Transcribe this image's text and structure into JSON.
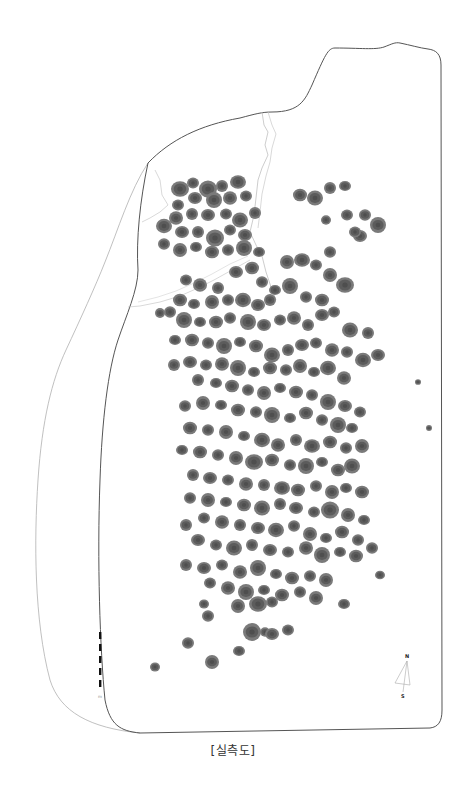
{
  "caption": "[실측도]",
  "colors": {
    "background": "#ffffff",
    "boundary_line": "#555555",
    "outer_line": "#aaaaaa",
    "crack_line": "#bbbbbb",
    "stone_outer": "#7a7a7a",
    "stone_inner": "#5c5c5c",
    "stone_core": "#4e4e4e",
    "scale_bar": "#111111"
  },
  "north_arrow": {
    "label_top": "N",
    "label_bottom": "S",
    "x": 407,
    "y": 655
  },
  "scale_bar": {
    "x": 100,
    "y_top": 632,
    "segments": 5,
    "segment_length": 7,
    "gap": 5,
    "label": "m"
  },
  "stones": [
    [
      180,
      189,
      9
    ],
    [
      193,
      183,
      6
    ],
    [
      208,
      189,
      9
    ],
    [
      222,
      186,
      6
    ],
    [
      238,
      182,
      8
    ],
    [
      246,
      196,
      6
    ],
    [
      230,
      198,
      7
    ],
    [
      214,
      200,
      8
    ],
    [
      195,
      198,
      7
    ],
    [
      178,
      205,
      6
    ],
    [
      176,
      218,
      7
    ],
    [
      192,
      214,
      6
    ],
    [
      208,
      215,
      7
    ],
    [
      226,
      214,
      6
    ],
    [
      240,
      220,
      8
    ],
    [
      255,
      213,
      6
    ],
    [
      245,
      235,
      7
    ],
    [
      230,
      230,
      6
    ],
    [
      215,
      238,
      9
    ],
    [
      198,
      232,
      6
    ],
    [
      182,
      232,
      7
    ],
    [
      164,
      226,
      8
    ],
    [
      164,
      244,
      6
    ],
    [
      180,
      250,
      7
    ],
    [
      196,
      247,
      6
    ],
    [
      212,
      252,
      7
    ],
    [
      228,
      250,
      6
    ],
    [
      244,
      248,
      8
    ],
    [
      259,
      252,
      6
    ],
    [
      300,
      195,
      7
    ],
    [
      315,
      198,
      8
    ],
    [
      330,
      188,
      6
    ],
    [
      345,
      186,
      6
    ],
    [
      347,
      215,
      6
    ],
    [
      365,
      215,
      6
    ],
    [
      378,
      225,
      8
    ],
    [
      360,
      236,
      7
    ],
    [
      355,
      232,
      6
    ],
    [
      326,
      220,
      5
    ],
    [
      287,
      262,
      7
    ],
    [
      302,
      260,
      8
    ],
    [
      316,
      265,
      6
    ],
    [
      330,
      252,
      6
    ],
    [
      330,
      275,
      7
    ],
    [
      345,
      285,
      9
    ],
    [
      322,
      300,
      7
    ],
    [
      306,
      297,
      6
    ],
    [
      290,
      286,
      8
    ],
    [
      275,
      290,
      6
    ],
    [
      186,
      280,
      6
    ],
    [
      200,
      285,
      7
    ],
    [
      218,
      288,
      6
    ],
    [
      236,
      272,
      7
    ],
    [
      252,
      268,
      7
    ],
    [
      262,
      282,
      6
    ],
    [
      270,
      300,
      6
    ],
    [
      258,
      305,
      7
    ],
    [
      243,
      300,
      8
    ],
    [
      228,
      300,
      6
    ],
    [
      212,
      302,
      7
    ],
    [
      194,
      304,
      6
    ],
    [
      180,
      300,
      7
    ],
    [
      170,
      312,
      6
    ],
    [
      184,
      320,
      8
    ],
    [
      200,
      322,
      6
    ],
    [
      216,
      322,
      7
    ],
    [
      230,
      318,
      6
    ],
    [
      248,
      322,
      8
    ],
    [
      264,
      325,
      7
    ],
    [
      280,
      320,
      6
    ],
    [
      294,
      318,
      7
    ],
    [
      308,
      325,
      6
    ],
    [
      322,
      315,
      7
    ],
    [
      334,
      312,
      6
    ],
    [
      350,
      330,
      8
    ],
    [
      368,
      333,
      6
    ],
    [
      378,
      355,
      7
    ],
    [
      363,
      360,
      8
    ],
    [
      347,
      352,
      6
    ],
    [
      160,
      313,
      5
    ],
    [
      175,
      340,
      6
    ],
    [
      192,
      340,
      7
    ],
    [
      208,
      343,
      6
    ],
    [
      224,
      346,
      8
    ],
    [
      240,
      342,
      6
    ],
    [
      256,
      346,
      7
    ],
    [
      272,
      355,
      8
    ],
    [
      288,
      350,
      6
    ],
    [
      302,
      345,
      7
    ],
    [
      316,
      343,
      6
    ],
    [
      332,
      350,
      7
    ],
    [
      174,
      365,
      6
    ],
    [
      190,
      362,
      7
    ],
    [
      206,
      365,
      6
    ],
    [
      222,
      364,
      7
    ],
    [
      238,
      368,
      8
    ],
    [
      254,
      372,
      6
    ],
    [
      270,
      368,
      7
    ],
    [
      286,
      370,
      6
    ],
    [
      300,
      366,
      7
    ],
    [
      314,
      372,
      6
    ],
    [
      328,
      368,
      8
    ],
    [
      344,
      378,
      7
    ],
    [
      198,
      380,
      6
    ],
    [
      216,
      383,
      6
    ],
    [
      232,
      386,
      7
    ],
    [
      248,
      390,
      6
    ],
    [
      264,
      393,
      7
    ],
    [
      280,
      388,
      6
    ],
    [
      296,
      392,
      7
    ],
    [
      312,
      395,
      6
    ],
    [
      328,
      402,
      8
    ],
    [
      345,
      406,
      7
    ],
    [
      360,
      412,
      6
    ],
    [
      185,
      406,
      6
    ],
    [
      203,
      403,
      7
    ],
    [
      221,
      405,
      6
    ],
    [
      238,
      410,
      7
    ],
    [
      256,
      412,
      6
    ],
    [
      272,
      415,
      8
    ],
    [
      290,
      418,
      6
    ],
    [
      306,
      413,
      7
    ],
    [
      322,
      420,
      6
    ],
    [
      338,
      425,
      8
    ],
    [
      352,
      428,
      6
    ],
    [
      190,
      428,
      7
    ],
    [
      208,
      430,
      6
    ],
    [
      226,
      432,
      7
    ],
    [
      244,
      436,
      6
    ],
    [
      262,
      440,
      8
    ],
    [
      278,
      445,
      7
    ],
    [
      296,
      440,
      6
    ],
    [
      312,
      446,
      8
    ],
    [
      330,
      442,
      7
    ],
    [
      346,
      448,
      6
    ],
    [
      362,
      446,
      7
    ],
    [
      182,
      450,
      6
    ],
    [
      200,
      452,
      7
    ],
    [
      218,
      455,
      6
    ],
    [
      236,
      458,
      7
    ],
    [
      254,
      462,
      9
    ],
    [
      272,
      460,
      7
    ],
    [
      290,
      465,
      6
    ],
    [
      306,
      466,
      8
    ],
    [
      322,
      462,
      6
    ],
    [
      338,
      470,
      7
    ],
    [
      352,
      466,
      8
    ],
    [
      193,
      475,
      6
    ],
    [
      210,
      478,
      7
    ],
    [
      228,
      480,
      6
    ],
    [
      246,
      484,
      7
    ],
    [
      264,
      485,
      6
    ],
    [
      282,
      488,
      8
    ],
    [
      298,
      490,
      7
    ],
    [
      316,
      486,
      6
    ],
    [
      332,
      492,
      7
    ],
    [
      346,
      488,
      6
    ],
    [
      362,
      492,
      7
    ],
    [
      190,
      498,
      6
    ],
    [
      208,
      500,
      7
    ],
    [
      226,
      502,
      6
    ],
    [
      244,
      505,
      7
    ],
    [
      262,
      508,
      8
    ],
    [
      280,
      504,
      6
    ],
    [
      296,
      508,
      7
    ],
    [
      314,
      512,
      6
    ],
    [
      330,
      510,
      9
    ],
    [
      348,
      515,
      7
    ],
    [
      364,
      520,
      6
    ],
    [
      204,
      518,
      6
    ],
    [
      222,
      522,
      7
    ],
    [
      240,
      525,
      6
    ],
    [
      258,
      528,
      7
    ],
    [
      276,
      530,
      8
    ],
    [
      294,
      526,
      6
    ],
    [
      310,
      534,
      7
    ],
    [
      326,
      538,
      6
    ],
    [
      342,
      532,
      7
    ],
    [
      358,
      540,
      6
    ],
    [
      186,
      525,
      6
    ],
    [
      198,
      540,
      7
    ],
    [
      216,
      545,
      6
    ],
    [
      234,
      548,
      8
    ],
    [
      252,
      545,
      6
    ],
    [
      270,
      550,
      7
    ],
    [
      288,
      552,
      6
    ],
    [
      306,
      548,
      7
    ],
    [
      322,
      555,
      8
    ],
    [
      340,
      552,
      6
    ],
    [
      356,
      556,
      7
    ],
    [
      372,
      548,
      6
    ],
    [
      186,
      565,
      6
    ],
    [
      204,
      568,
      7
    ],
    [
      222,
      565,
      6
    ],
    [
      240,
      572,
      7
    ],
    [
      258,
      568,
      8
    ],
    [
      276,
      574,
      6
    ],
    [
      292,
      578,
      7
    ],
    [
      310,
      576,
      6
    ],
    [
      326,
      580,
      7
    ],
    [
      380,
      575,
      5
    ],
    [
      210,
      583,
      6
    ],
    [
      228,
      588,
      7
    ],
    [
      246,
      592,
      8
    ],
    [
      264,
      590,
      6
    ],
    [
      282,
      595,
      7
    ],
    [
      300,
      592,
      6
    ],
    [
      316,
      598,
      7
    ],
    [
      344,
      604,
      6
    ],
    [
      204,
      604,
      5
    ],
    [
      208,
      616,
      6
    ],
    [
      238,
      606,
      7
    ],
    [
      258,
      604,
      9
    ],
    [
      272,
      602,
      6
    ],
    [
      265,
      632,
      5
    ],
    [
      252,
      632,
      9
    ],
    [
      272,
      634,
      7
    ],
    [
      288,
      630,
      6
    ],
    [
      188,
      643,
      6
    ],
    [
      212,
      662,
      7
    ],
    [
      239,
      651,
      6
    ],
    [
      155,
      667,
      5
    ],
    [
      418,
      382,
      3
    ],
    [
      429,
      428,
      3
    ]
  ]
}
